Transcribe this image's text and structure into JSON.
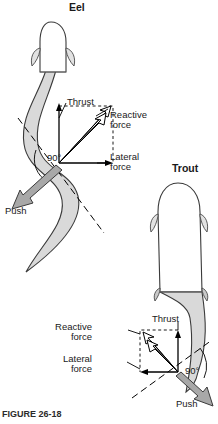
{
  "figure": {
    "caption": "FIGURE 26-18",
    "colors": {
      "body_fill": "#d9d9d9",
      "body_outline": "#3a3a3a",
      "arrow_fill": "#a8a8a8",
      "line": "#000000",
      "dashed": "#000000",
      "text": "#1a1a1a"
    }
  },
  "panels": [
    {
      "id": "eel",
      "title": "Eel",
      "title_pos": {
        "x": 69,
        "y": 2
      },
      "labels": [
        {
          "name": "thrust-label",
          "text": "Thrust",
          "x": 67,
          "y": 97,
          "align": "left"
        },
        {
          "name": "reactive-force-label",
          "text": "Reactive\nforce",
          "x": 110,
          "y": 110,
          "align": "left"
        },
        {
          "name": "lateral-force-label",
          "text": "Lateral\nforce",
          "x": 110,
          "y": 152,
          "align": "left"
        },
        {
          "name": "angle-label",
          "text": "90°",
          "x": 47,
          "y": 153,
          "align": "left"
        },
        {
          "name": "push-label",
          "text": "Push",
          "x": 5,
          "y": 206,
          "align": "left"
        }
      ],
      "origin": {
        "x": 59,
        "y": 163
      }
    },
    {
      "id": "trout",
      "title": "Trout",
      "title_pos": {
        "x": 172,
        "y": 163
      },
      "labels": [
        {
          "name": "thrust-label",
          "text": "Thrust",
          "x": 152,
          "y": 314,
          "align": "left"
        },
        {
          "name": "reactive-force-label",
          "text": "Reactive\nforce",
          "x": 92,
          "y": 322,
          "align": "right"
        },
        {
          "name": "lateral-force-label",
          "text": "Lateral\nforce",
          "x": 92,
          "y": 354,
          "align": "right"
        },
        {
          "name": "angle-label",
          "text": "90°",
          "x": 185,
          "y": 366,
          "align": "left"
        },
        {
          "name": "push-label",
          "text": "Push",
          "x": 176,
          "y": 399,
          "align": "left"
        }
      ],
      "origin": {
        "x": 178,
        "y": 372
      }
    }
  ],
  "vectors": {
    "thrust": "Thrust",
    "reactive_force": "Reactive force",
    "lateral_force": "Lateral force",
    "push": "Push",
    "angle": "90°"
  }
}
